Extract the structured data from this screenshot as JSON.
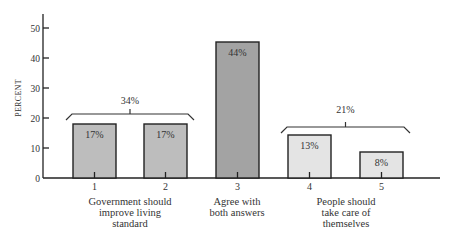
{
  "chart_data": {
    "type": "bar",
    "title": "",
    "xlabel": "",
    "ylabel": "PERCENT",
    "ylim": [
      0,
      55
    ],
    "yticks": [
      0,
      10,
      20,
      30,
      40,
      50
    ],
    "grid": false,
    "categories": [
      "1",
      "2",
      "3",
      "4",
      "5"
    ],
    "values": [
      17,
      18,
      44,
      13,
      8
    ],
    "value_labels": [
      "17%",
      "17%",
      "44%",
      "13%",
      "8%"
    ],
    "bar_colors": [
      "#bdbdbd",
      "#bdbdbd",
      "#a3a3a3",
      "#e4e4e4",
      "#e4e4e4"
    ],
    "groups": [
      {
        "label_lines": [
          "Government should",
          "improve living",
          "standard"
        ],
        "categories": [
          "1",
          "2"
        ],
        "bracket_total": "34%"
      },
      {
        "label_lines": [
          "Agree with",
          "both answers"
        ],
        "categories": [
          "3"
        ]
      },
      {
        "label_lines": [
          "People should",
          "take care of",
          "themselves"
        ],
        "categories": [
          "4",
          "5"
        ],
        "bracket_total": "21%"
      }
    ]
  }
}
